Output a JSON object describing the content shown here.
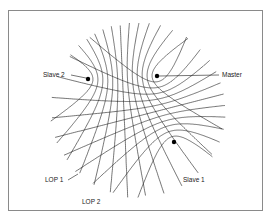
{
  "figure": {
    "stations": [
      {
        "id": "slave2",
        "label": "Slave 2",
        "x": 88,
        "y": 79
      },
      {
        "id": "master",
        "label": "Master",
        "x": 157,
        "y": 76
      },
      {
        "id": "slave1",
        "label": "Slave 1",
        "x": 174,
        "y": 142
      }
    ],
    "labels": {
      "slave2": {
        "text": "Slave 2",
        "x": 43,
        "y": 72,
        "line": [
          71,
          75,
          86,
          78
        ]
      },
      "master": {
        "text": "Master",
        "x": 222,
        "y": 72,
        "line": [
          159,
          76,
          219,
          75
        ]
      },
      "slave1": {
        "text": "Slave 1",
        "x": 183,
        "y": 177
      },
      "lop1": {
        "text": "LOP 1",
        "x": 45,
        "y": 177,
        "line": [
          68,
          180,
          78,
          174
        ]
      },
      "lop2": {
        "text": "LOP 2",
        "x": 82,
        "y": 199
      }
    },
    "families": [
      {
        "name": "master-slave2",
        "foci": [
          "master",
          "slave2"
        ],
        "count": 13
      },
      {
        "name": "master-slave1",
        "foci": [
          "master",
          "slave1"
        ],
        "count": 11
      }
    ],
    "region": {
      "cx": 138,
      "cy": 110,
      "r": 88
    },
    "line_color": "#1a1a1a",
    "border_color": "#8a8a8a"
  }
}
